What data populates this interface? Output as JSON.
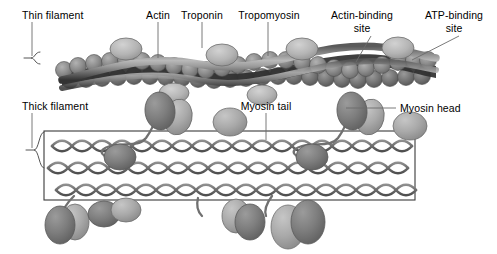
{
  "figure": {
    "background_color": "#ffffff"
  },
  "labels": {
    "thin_filament": "Thin filament",
    "actin": "Actin",
    "troponin": "Troponin",
    "tropomyosin": "Tropomyosin",
    "actin_binding_site_line1": "Actin-binding",
    "actin_binding_site_line2": "site",
    "atp_binding_site_line1": "ATP-binding",
    "atp_binding_site_line2": "site",
    "thick_filament": "Thick filament",
    "myosin_tail": "Myosin tail",
    "myosin_head": "Myosin head"
  },
  "colors": {
    "actin_bead": "#8d8d8d",
    "actin_bead_dark": "#6f6f6f",
    "tropomyosin_band": "#3f3f3f",
    "troponin": "#b4b4b4",
    "myosin_head_dark": "#7d7d7d",
    "myosin_head_light": "#a9a9a9",
    "myosin_tail_stroke": "#707070",
    "filament_box_border": "#3a3a3a",
    "bracket": "#555555",
    "leader_line": "#6b6b6b",
    "text": "#000000"
  },
  "structures": {
    "thin_filament": {
      "troponin_count": 4,
      "actin_rows": 2,
      "tropomyosin_strands": 2,
      "x_start": 62,
      "x_end": 436
    },
    "thick_filament": {
      "coil_rows": 3,
      "box_x_start": 44,
      "box_x_end": 415,
      "myosin_heads_top": 3,
      "myosin_heads_bottom": 5
    }
  }
}
